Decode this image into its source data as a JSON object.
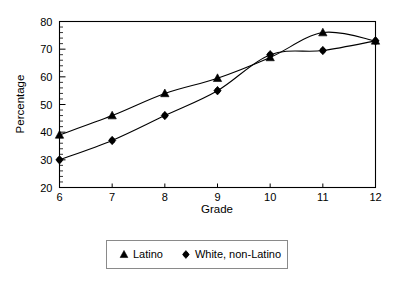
{
  "chart_data": {
    "type": "line",
    "title": "",
    "xlabel": "Grade",
    "ylabel": "Percentage",
    "x": [
      6,
      7,
      8,
      9,
      10,
      11,
      12
    ],
    "categories": [
      "6",
      "7",
      "8",
      "9",
      "10",
      "11",
      "12"
    ],
    "xlim": [
      6,
      12
    ],
    "ylim": [
      20,
      80
    ],
    "y_ticks": [
      20,
      30,
      40,
      50,
      60,
      70,
      80
    ],
    "y_tick_labels": [
      "20",
      "30",
      "40",
      "50",
      "60",
      "70",
      "80"
    ],
    "y_minor_tick_step": 2,
    "x_tick_labels": [
      "6",
      "7",
      "8",
      "9",
      "10",
      "11",
      "12"
    ],
    "grid": false,
    "legend_position": "bottom",
    "series": [
      {
        "name": "Latino",
        "marker": "triangle",
        "color": "#000000",
        "values": [
          39,
          46,
          54,
          59.5,
          67,
          76,
          73
        ]
      },
      {
        "name": "White, non-Latino",
        "marker": "diamond",
        "color": "#000000",
        "values": [
          30,
          37,
          46,
          55,
          68,
          69.5,
          73
        ]
      }
    ]
  },
  "legend": {
    "entries": [
      {
        "label": "Latino",
        "marker": "triangle-icon"
      },
      {
        "label": "White, non-Latino",
        "marker": "diamond-icon"
      }
    ]
  }
}
